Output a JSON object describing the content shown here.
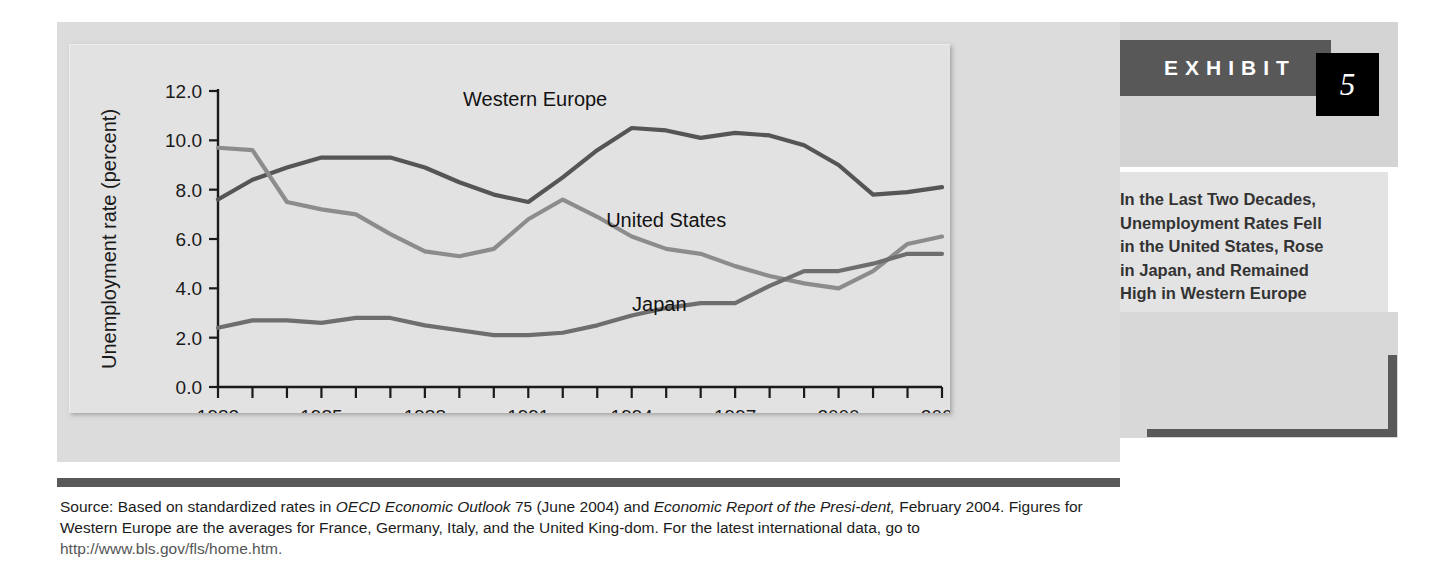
{
  "exhibit": {
    "word": "EXHIBIT",
    "number": "5",
    "caption_lines": [
      "In the Last Two Decades,",
      "Unemployment Rates Fell",
      "in the United States, Rose",
      "in Japan, and Remained",
      "High in Western Europe"
    ]
  },
  "source_note": {
    "part1": "Source: Based on standardized rates in ",
    "italic1": "OECD Economic Outlook",
    "part2": " 75 (June 2004) and ",
    "italic2": "Economic Report of the Presi-",
    "italic3": "dent,",
    "part3": " February 2004. Figures for Western Europe are the averages for France, Germany, Italy, and the United King-",
    "part4": "dom. For the latest international data, go to ",
    "url": "http://www.bls.gov/fls/home.htm."
  },
  "chart_data": {
    "type": "line",
    "title": "",
    "xlabel": "",
    "ylabel": "Unemployment rate (percent)",
    "ylim": [
      0.0,
      12.0
    ],
    "ytick_values": [
      0.0,
      2.0,
      4.0,
      6.0,
      8.0,
      10.0,
      12.0
    ],
    "ytick_labels": [
      "0.0",
      "2.0",
      "4.0",
      "6.0",
      "8.0",
      "10.0",
      "12.0"
    ],
    "xlim": [
      1982,
      2003
    ],
    "x": [
      1982,
      1983,
      1984,
      1985,
      1986,
      1987,
      1988,
      1989,
      1990,
      1991,
      1992,
      1993,
      1994,
      1995,
      1996,
      1997,
      1998,
      1999,
      2000,
      2001,
      2002,
      2003
    ],
    "xtick_values": [
      1982,
      1983,
      1984,
      1985,
      1986,
      1987,
      1988,
      1989,
      1990,
      1991,
      1992,
      1993,
      1994,
      1995,
      1996,
      1997,
      1998,
      1999,
      2000,
      2001,
      2002,
      2003
    ],
    "xtick_labels_shown": [
      "1982",
      "1985",
      "1988",
      "1991",
      "1994",
      "1997",
      "2000",
      "2003"
    ],
    "grid": false,
    "legend_position": "inline-annotations",
    "series": [
      {
        "name": "Western Europe",
        "color": "#555555",
        "label_x": 1991.2,
        "label_y": 11.4,
        "values": [
          7.6,
          8.4,
          8.9,
          9.3,
          9.3,
          9.3,
          8.9,
          8.3,
          7.8,
          7.5,
          8.5,
          9.6,
          10.5,
          10.4,
          10.1,
          10.3,
          10.2,
          9.8,
          9.0,
          7.8,
          7.9,
          8.1
        ]
      },
      {
        "name": "United States",
        "color": "#8c8c8c",
        "label_x": 1995.0,
        "label_y": 6.5,
        "values": [
          9.7,
          9.6,
          7.5,
          7.2,
          7.0,
          6.2,
          5.5,
          5.3,
          5.6,
          6.8,
          7.6,
          6.9,
          6.1,
          5.6,
          5.4,
          4.9,
          4.5,
          4.2,
          4.0,
          4.7,
          5.8,
          6.1
        ]
      },
      {
        "name": "Japan",
        "color": "#6e6e6e",
        "label_x": 1994.8,
        "label_y": 3.1,
        "values": [
          2.4,
          2.7,
          2.7,
          2.6,
          2.8,
          2.8,
          2.5,
          2.3,
          2.1,
          2.1,
          2.2,
          2.5,
          2.9,
          3.2,
          3.4,
          3.4,
          4.1,
          4.7,
          4.7,
          5.0,
          5.4,
          5.4
        ]
      }
    ]
  }
}
